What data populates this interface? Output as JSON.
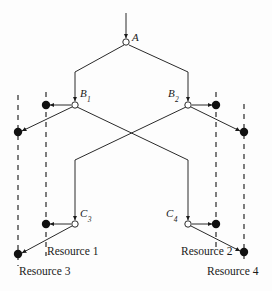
{
  "figure": {
    "type": "tree-diagram",
    "background_color": "#fdfdfd",
    "line_color": "#2a2a2a",
    "dash_color": "#3a3a3a",
    "node_fill": "#ffffff"
  },
  "nodes": [
    {
      "id": "A",
      "label": "A",
      "sub": "",
      "x": 126,
      "y": 42,
      "label_x": 132,
      "label_y": 32
    },
    {
      "id": "B1",
      "label": "B",
      "sub": "1",
      "x": 75,
      "y": 105,
      "label_x": 80,
      "label_y": 88
    },
    {
      "id": "B2",
      "label": "B",
      "sub": "2",
      "x": 188,
      "y": 105,
      "label_x": 168,
      "label_y": 88
    },
    {
      "id": "C3",
      "label": "C",
      "sub": "3",
      "x": 75,
      "y": 224,
      "label_x": 80,
      "label_y": 208
    },
    {
      "id": "C4",
      "label": "C",
      "sub": "4",
      "x": 188,
      "y": 224,
      "label_x": 166,
      "label_y": 208
    }
  ],
  "resource_labels": [
    {
      "text": "Resource 1",
      "x": 47,
      "y": 246
    },
    {
      "text": "Resource 2",
      "x": 181,
      "y": 246
    },
    {
      "text": "Resource 3",
      "x": 19,
      "y": 266
    },
    {
      "text": "Resource 4",
      "x": 207,
      "y": 266
    }
  ],
  "dashed_lines": [
    {
      "name": "dashed-resource-3",
      "x": 18,
      "y1": 95,
      "y2": 266
    },
    {
      "name": "dashed-resource-1",
      "x": 46,
      "y1": 92,
      "y2": 256
    },
    {
      "name": "dashed-resource-2",
      "x": 216,
      "y1": 92,
      "y2": 252
    },
    {
      "name": "dashed-resource-4",
      "x": 244,
      "y1": 104,
      "y2": 264
    }
  ],
  "dots": [
    {
      "name": "dot-b1-left",
      "x": 46,
      "y": 105
    },
    {
      "name": "dot-b1-lower",
      "x": 18,
      "y": 132
    },
    {
      "name": "dot-b2-right",
      "x": 216,
      "y": 105
    },
    {
      "name": "dot-b2-lower",
      "x": 244,
      "y": 132
    },
    {
      "name": "dot-c3-left",
      "x": 46,
      "y": 224
    },
    {
      "name": "dot-c3-lower",
      "x": 18,
      "y": 254
    },
    {
      "name": "dot-c4-right",
      "x": 216,
      "y": 224
    },
    {
      "name": "dot-c4-lower",
      "x": 244,
      "y": 252
    }
  ],
  "edges": [
    {
      "name": "edge-input-to-a",
      "points": "126,13 126,38"
    },
    {
      "name": "edge-a-to-b1",
      "points": "124,45 75,72 75,101"
    },
    {
      "name": "edge-a-to-b2",
      "points": "129,45 188,72 188,101"
    },
    {
      "name": "edge-b1-to-dot",
      "points": "71,105 50,105"
    },
    {
      "name": "edge-b1-to-lower",
      "points": "72,107 22,131"
    },
    {
      "name": "edge-b2-to-dot",
      "points": "192,105 212,105"
    },
    {
      "name": "edge-b2-to-lower",
      "points": "191,107 240,131"
    },
    {
      "name": "edge-b1-cross-c4",
      "points": "77,107 188,160 188,220"
    },
    {
      "name": "edge-b2-cross-c3",
      "points": "186,107 75,160 75,220"
    },
    {
      "name": "edge-c3-to-dot",
      "points": "71,224 50,224"
    },
    {
      "name": "edge-c3-to-lower",
      "points": "72,226 22,253"
    },
    {
      "name": "edge-c4-to-dot",
      "points": "192,224 212,224"
    },
    {
      "name": "edge-c4-to-lower",
      "points": "191,226 240,251"
    }
  ]
}
